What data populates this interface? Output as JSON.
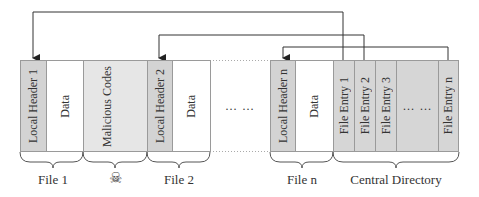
{
  "blocks": {
    "local_header_1": "Local Header 1",
    "data_1": "Data",
    "malicious": "Malicious Codes",
    "local_header_2": "Local Header 2",
    "data_2": "Data",
    "gap_ellipsis": "… …",
    "local_header_n": "Local Header n",
    "data_n": "Data",
    "file_entry_1": "File Entry 1",
    "file_entry_2": "File Entry 2",
    "file_entry_3": "File Entry 3",
    "entry_ellipsis": "… …",
    "file_entry_n": "File Entry n"
  },
  "labels": {
    "file_1": "File 1",
    "malicious_icon": "☠",
    "file_2": "File 2",
    "file_n": "File n",
    "central_directory": "Central Directory"
  },
  "colors": {
    "header_fill": "#d3d3d3",
    "entry_fill": "#d6d6d6",
    "malicious_fill": "#e6e6e6",
    "border": "#9a9a9a",
    "arrow": "#333333"
  }
}
